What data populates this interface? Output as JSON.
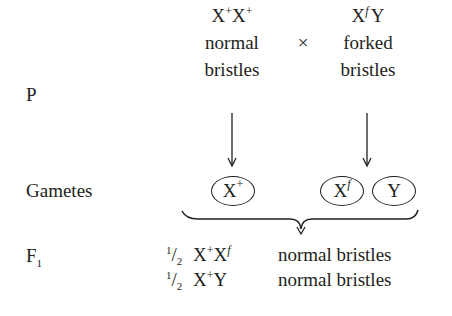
{
  "diagram": {
    "row_labels": {
      "parents": "P",
      "gametes": "Gametes",
      "f1_base": "F",
      "f1_sub": "1"
    },
    "cross_symbol": "×",
    "parents": [
      {
        "genotype_parts": [
          "X",
          "+",
          "X",
          "+"
        ],
        "phenotype_line1": "normal",
        "phenotype_line2": "bristles",
        "sex": "female"
      },
      {
        "genotype_parts": [
          "X",
          "f",
          "Y"
        ],
        "phenotype_line1": "forked",
        "phenotype_line2": "bristles",
        "sex": "male"
      }
    ],
    "gametes": [
      {
        "base": "X",
        "sup": "+"
      },
      {
        "base": "X",
        "sup": "f"
      },
      {
        "base": "Y",
        "sup": ""
      }
    ],
    "f1": [
      {
        "frac_num": "1",
        "frac_den": "2",
        "geno_a": "X",
        "geno_a_sup": "+",
        "geno_b": "X",
        "geno_b_sup": "f",
        "phenotype": "normal bristles"
      },
      {
        "frac_num": "1",
        "frac_den": "2",
        "geno_a": "X",
        "geno_a_sup": "+",
        "geno_b": "Y",
        "geno_b_sup": "",
        "phenotype": "normal bristles"
      }
    ],
    "colors": {
      "ink": "#231f20",
      "background": "#ffffff"
    }
  }
}
